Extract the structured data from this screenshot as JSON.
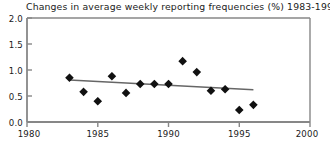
{
  "chart_data": {
    "type": "scatter",
    "title": "Changes in average weekly reporting frequencies (%) 1983-1996",
    "xlabel": "",
    "ylabel": "",
    "xlim": [
      1980,
      2000
    ],
    "ylim": [
      0.0,
      2.0
    ],
    "grid": false,
    "legend": null,
    "x_ticks": [
      1980,
      1985,
      1990,
      1995,
      2000
    ],
    "x_tick_labels": [
      "1980",
      "1985",
      "1990",
      "1995",
      "2000"
    ],
    "y_ticks": [
      0.0,
      0.5,
      1.0,
      1.5,
      2.0
    ],
    "y_tick_labels": [
      "0.0",
      "0.5",
      "1.0",
      "1.5",
      "2.0"
    ],
    "marker": "diamond",
    "marker_color": "#111111",
    "series": [
      {
        "name": "Average weekly reporting frequency change",
        "x": [
          1983,
          1984,
          1985,
          1986,
          1987,
          1988,
          1989,
          1990,
          1991,
          1992,
          1993,
          1994,
          1995,
          1996
        ],
        "values": [
          0.85,
          0.58,
          0.4,
          0.88,
          0.56,
          0.73,
          0.73,
          0.73,
          1.17,
          0.96,
          0.6,
          0.63,
          0.23,
          0.33
        ]
      }
    ],
    "trendline": {
      "name": "linear trend",
      "color": "#666666",
      "x": [
        1983,
        1996
      ],
      "values": [
        0.81,
        0.62
      ]
    }
  },
  "axes": {
    "frame_color": "#808080",
    "background": "#ffffff"
  }
}
